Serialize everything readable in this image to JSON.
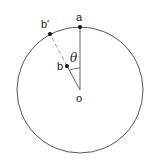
{
  "diagram": {
    "labels": {
      "a": "a",
      "b_prime": "b'",
      "b": "b",
      "o": "o",
      "theta": "θ"
    },
    "colors": {
      "circle": "#555555",
      "line": "#888888",
      "point": "#111111"
    }
  }
}
